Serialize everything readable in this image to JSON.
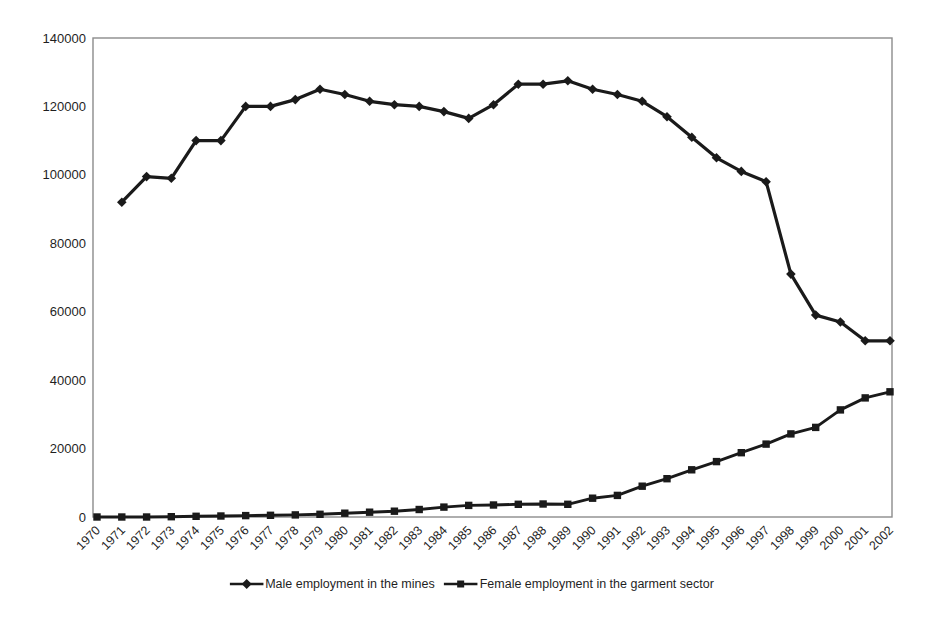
{
  "colors": {
    "line": "#1a1a1a",
    "axis": "#8c8c8c",
    "text": "#1f1f1f",
    "background": "#ffffff"
  },
  "chart_data": {
    "type": "line",
    "grid": false,
    "legend_position": "bottom",
    "ylim": [
      0,
      140000
    ],
    "y_ticks": [
      0,
      20000,
      40000,
      60000,
      80000,
      100000,
      120000,
      140000
    ],
    "categories": [
      "1970",
      "1971",
      "1972",
      "1973",
      "1974",
      "1975",
      "1976",
      "1977",
      "1978",
      "1979",
      "1980",
      "1981",
      "1982",
      "1983",
      "1984",
      "1985",
      "1986",
      "1987",
      "1988",
      "1989",
      "1990",
      "1991",
      "1992",
      "1993",
      "1994",
      "1995",
      "1996",
      "1997",
      "1998",
      "1999",
      "2000",
      "2001",
      "2002"
    ],
    "series": [
      {
        "name": "Male employment in the mines",
        "marker": "diamond",
        "values": [
          null,
          92000,
          99500,
          99000,
          110000,
          110000,
          120000,
          120000,
          122000,
          125000,
          123500,
          121500,
          120500,
          120000,
          118500,
          116500,
          120500,
          126500,
          126500,
          127500,
          125000,
          123500,
          121500,
          117000,
          111000,
          105000,
          101000,
          98000,
          71000,
          59000,
          57000,
          51500,
          51500
        ]
      },
      {
        "name": "Female employment in the garment sector",
        "marker": "square",
        "values": [
          0,
          0,
          0,
          100,
          200,
          300,
          400,
          500,
          600,
          800,
          1100,
          1400,
          1700,
          2200,
          2900,
          3400,
          3500,
          3700,
          3800,
          3700,
          5500,
          6300,
          9000,
          11200,
          13800,
          16200,
          18800,
          21300,
          24300,
          26200,
          31300,
          34800,
          36600
        ]
      }
    ]
  }
}
